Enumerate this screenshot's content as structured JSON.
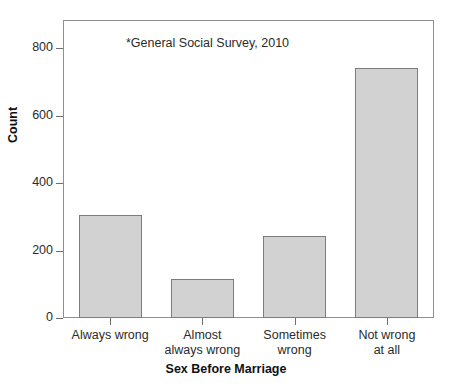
{
  "chart_data": {
    "type": "bar",
    "title": "",
    "subtitle": "",
    "annotation": "*General Social Survey, 2010",
    "categories": [
      "Always wrong",
      "Almost always wrong",
      "Sometimes wrong",
      "Not wrong at all"
    ],
    "category_lines": [
      [
        "Always wrong"
      ],
      [
        "Almost",
        "always wrong"
      ],
      [
        "Sometimes",
        "wrong"
      ],
      [
        "Not wrong",
        "at all"
      ]
    ],
    "values": [
      305,
      115,
      243,
      740
    ],
    "xlabel": "Sex Before Marriage",
    "ylabel": "Count",
    "ylim": [
      0,
      880
    ],
    "yticks": [
      0,
      200,
      400,
      600,
      800
    ],
    "ytick_labels": [
      "0",
      "200",
      "400",
      "600",
      "800"
    ],
    "grid": false,
    "legend": false,
    "colors": {
      "bar_fill": "#d2d2d2",
      "bar_border": "#7d7d7d",
      "axis": "#8f8f8f",
      "text": "#2b2b2b",
      "background": "#ffffff"
    }
  }
}
